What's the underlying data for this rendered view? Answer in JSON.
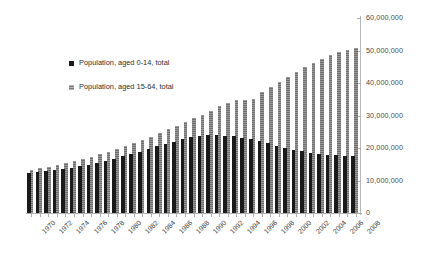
{
  "chart_data": {
    "type": "bar",
    "title": "",
    "subtitle": "",
    "xlabel": "",
    "ylabel": "",
    "ylim": [
      0,
      60000000
    ],
    "ytick_labels": [
      "0",
      "10,000,000",
      "20,000,000",
      "30,000,000",
      "40,000,000",
      "50,000,000",
      "60,000,000"
    ],
    "ytick_values": [
      0,
      10000000,
      20000000,
      30000000,
      40000000,
      50000000,
      60000000
    ],
    "y_axis_position": "right",
    "grid": false,
    "legend_position": "upper-left-inside",
    "x": [
      1970,
      1971,
      1972,
      1973,
      1974,
      1975,
      1976,
      1977,
      1978,
      1979,
      1980,
      1981,
      1982,
      1983,
      1984,
      1985,
      1986,
      1987,
      1988,
      1989,
      1990,
      1991,
      1992,
      1993,
      1994,
      1995,
      1996,
      1997,
      1998,
      1999,
      2000,
      2001,
      2002,
      2003,
      2004,
      2005,
      2006,
      2007,
      2008
    ],
    "xtick_labels": [
      "1970",
      "1972",
      "1974",
      "1976",
      "1978",
      "1980",
      "1982",
      "1984",
      "1986",
      "1988",
      "1990",
      "1992",
      "1994",
      "1996",
      "1998",
      "2000",
      "2002",
      "2004",
      "2006",
      "2008"
    ],
    "series": [
      {
        "name": "Population, aged 0-14, total",
        "color": "#1a1a1a",
        "values": [
          12300000,
          12600000,
          12900000,
          13200000,
          13600000,
          14000000,
          14400000,
          14900000,
          15400000,
          16000000,
          16700000,
          17400000,
          18100000,
          18900000,
          19700000,
          20500000,
          21300000,
          22000000,
          22700000,
          23300000,
          23700000,
          23900000,
          23900000,
          23800000,
          23600000,
          23200000,
          22700000,
          22100000,
          21400000,
          20700000,
          20100000,
          19500000,
          19000000,
          18600000,
          18200000,
          17900000,
          17700000,
          17500000,
          17400000
        ]
      },
      {
        "name": "Population, aged 15-64, total",
        "color": "#6e6e6e",
        "values": [
          13200000,
          13700000,
          14200000,
          14700000,
          15300000,
          15900000,
          16600000,
          17300000,
          18100000,
          18900000,
          19700000,
          20600000,
          21500000,
          22500000,
          23500000,
          24600000,
          25700000,
          26800000,
          27900000,
          29100000,
          30300000,
          31500000,
          32800000,
          34000000,
          34800000,
          34700000,
          35100000,
          37300000,
          38900000,
          40300000,
          41800000,
          43300000,
          44800000,
          46200000,
          47400000,
          48600000,
          49600000,
          50200000,
          50800000
        ]
      }
    ]
  },
  "legend": {
    "items": [
      {
        "label": "Population, aged 0-14, total",
        "marker": "solid-black-square"
      },
      {
        "label": "Population, aged 15-64, total",
        "marker": "hatched-gray-square"
      }
    ]
  },
  "colors": {
    "series_young": "#1a1a1a",
    "series_older": "#6e6e6e",
    "axis": "#b0b0b0",
    "tick_text": "#4a4a4a",
    "background": "#ffffff"
  }
}
